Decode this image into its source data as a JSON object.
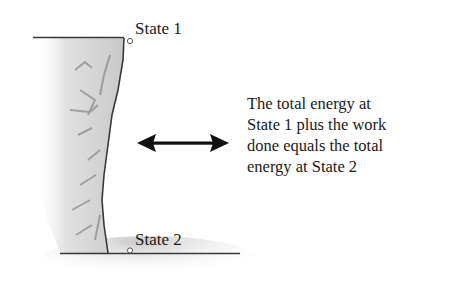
{
  "diagram": {
    "state1": {
      "label": "State 1"
    },
    "state2": {
      "label": "State 2"
    },
    "arrow": {
      "icon": "double-headed-arrow-icon"
    },
    "caption": {
      "lines": [
        "The total energy at",
        "State 1 plus the work",
        "done equals the total",
        "energy at State 2"
      ]
    },
    "colors": {
      "line": "#3a3a3a",
      "cliff_light": "#e6e6e6",
      "cliff_dark": "#9a9a9a",
      "ground_shadow": "#d0d0d0"
    }
  }
}
